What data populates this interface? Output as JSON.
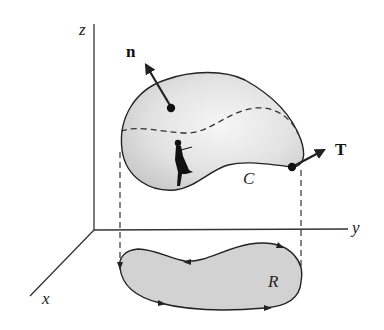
{
  "figure": {
    "axes": {
      "z_label": "z",
      "y_label": "y",
      "x_label": "x"
    },
    "vectors": {
      "normal_label": "n",
      "tangent_label": "T"
    },
    "curves": {
      "boundary_label": "C",
      "region_label": "R"
    },
    "colors": {
      "surface_fill": "#dcdcdc",
      "surface_highlight": "#f4f4f4",
      "region_fill": "#d2d2d2",
      "stroke": "#222222",
      "axis": "#333333"
    }
  }
}
